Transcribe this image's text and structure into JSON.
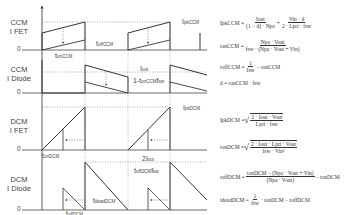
{
  "rows": [
    {
      "id": "ccm-fet",
      "label_line1": "CCM",
      "label_line2": "I FET",
      "zero": "0"
    },
    {
      "id": "ccm-diode",
      "label_line1": "CCM",
      "label_line2": "I Diode",
      "zero": "0"
    },
    {
      "id": "dcm-fet",
      "label_line1": "DCM",
      "label_line2": "I FET",
      "zero": "0"
    },
    {
      "id": "dcm-diode",
      "label_line1": "DCM",
      "label_line2": "I Diode",
      "zero": "0"
    }
  ],
  "annotations": {
    "ipk_ccm": "I",
    "ipk_ccm_sub": "pkCCM",
    "ton_ccm": "t",
    "ton_ccm_sub": "onCCM",
    "toff_ccm": "t",
    "toff_ccm_sub": "offCCM",
    "iout_num": "I",
    "iout_num_sub": "out",
    "iout_den": "1-t",
    "iout_den_sub": "onCCM",
    "iout_den_tail": "f",
    "iout_den_tail_sub": "sw",
    "ipk_dcm": "I",
    "ipk_dcm_sub": "pkDCM",
    "ton_dcm": "t",
    "ton_dcm_sub": "onDCM",
    "twoiout_num": "2I",
    "twoiout_num_sub": "out",
    "twoiout_den": "t",
    "twoiout_den_sub": "offDCM",
    "twoiout_den_tail": "f",
    "twoiout_den_tail_sub": "sw",
    "toff_dcm": "t",
    "toff_dcm_sub": "offDCM",
    "tdead_dcm": "t",
    "tdead_dcm_sub": "deadDCM"
  },
  "equations": {
    "ipk_ccm": {
      "lhs": "IpkCCM =",
      "t1_num": "Iout",
      "t1_den": "(1 − d) · Npa",
      "plus": "+",
      "t2_num": "Vin · d",
      "t2_den": "2 · Lpri · fsw"
    },
    "ton_ccm": {
      "lhs": "tonCCM =",
      "num": "Npa · Vout",
      "den": "fsw · (Npa · Vout + Vin)"
    },
    "toff_ccm": {
      "lhs": "toffCCM =",
      "num": "1",
      "den": "fsw",
      "tail": "− tonCCM"
    },
    "d": {
      "text": "d = tonCCM · fsw"
    },
    "ipk_dcm": {
      "lhs": "IpkDCM =",
      "num": "2 · Iout · Vout",
      "den": "Lpri · fsw"
    },
    "ton_dcm": {
      "lhs": "tonDCM =",
      "num": "2 · Iout · Lpri · Vout",
      "den": "fsw · Vin²"
    },
    "toff_dcm": {
      "lhs": "toffDCM =",
      "num": "tonDCM − (Npa · Vout + Vin)",
      "den": "(Npa · Vout)",
      "tail": "− tonDCM"
    },
    "tdead_dcm": {
      "lhs": "tdeadDCM =",
      "num": "1",
      "den": "fsw",
      "tail": "· tonDCM − toffDCM"
    }
  },
  "colors": {
    "line": "#333333",
    "dotted": "#555555",
    "background": "#ffffff"
  }
}
